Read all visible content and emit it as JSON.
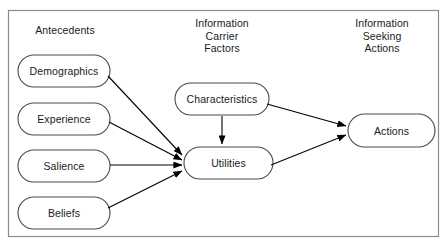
{
  "diagram": {
    "border_color": "#8c8c8c",
    "node_stroke": "#4a4a4a",
    "node_fill": "#ffffff",
    "arrow_color": "#000000",
    "text_color": "#1a1a1a",
    "columns": [
      {
        "id": "antecedents",
        "label": "Antecedents"
      },
      {
        "id": "information-carrier-factors",
        "label": "Information\nCarrier\nFactors"
      },
      {
        "id": "information-seeking-actions",
        "label": "Information\nSeeking\nActions"
      }
    ],
    "nodes": [
      {
        "id": "demographics",
        "label": "Demographics",
        "column": "antecedents"
      },
      {
        "id": "experience",
        "label": "Experience",
        "column": "antecedents"
      },
      {
        "id": "salience",
        "label": "Salience",
        "column": "antecedents"
      },
      {
        "id": "beliefs",
        "label": "Beliefs",
        "column": "antecedents"
      },
      {
        "id": "characteristics",
        "label": "Characteristics",
        "column": "information-carrier-factors"
      },
      {
        "id": "utilities",
        "label": "Utilities",
        "column": "information-carrier-factors"
      },
      {
        "id": "actions",
        "label": "Actions",
        "column": "information-seeking-actions"
      }
    ],
    "edges": [
      {
        "from": "demographics",
        "to": "utilities"
      },
      {
        "from": "experience",
        "to": "utilities"
      },
      {
        "from": "salience",
        "to": "utilities"
      },
      {
        "from": "beliefs",
        "to": "utilities"
      },
      {
        "from": "characteristics",
        "to": "utilities"
      },
      {
        "from": "characteristics",
        "to": "actions"
      },
      {
        "from": "utilities",
        "to": "actions"
      }
    ]
  }
}
